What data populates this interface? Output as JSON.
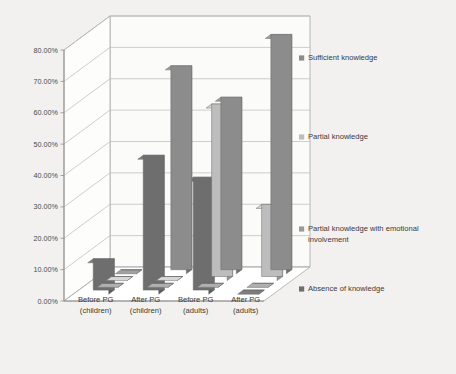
{
  "chart_data": {
    "type": "bar",
    "title": "",
    "subtitle": "",
    "xlabel": "",
    "ylabel": "",
    "categories": [
      "Before PG (children)",
      "After PG (children)",
      "Before PG (adults)",
      "After PG (adults)"
    ],
    "category_lines": [
      [
        "Before PG",
        "(children)"
      ],
      [
        "After PG",
        "(children)"
      ],
      [
        "Before PG",
        "(adults)"
      ],
      [
        "After PG",
        "(adults)"
      ]
    ],
    "series": [
      {
        "name": "Sufficient knowledge",
        "color": "#8c8c8c",
        "values": [
          0,
          65,
          55,
          75
        ]
      },
      {
        "name": "Partial knowledge",
        "color": "#bdbdbd",
        "values": [
          0,
          0,
          55,
          23
        ]
      },
      {
        "name": "Partial knowledge with emotional involvement",
        "color": "#9a9a9a",
        "values": [
          0,
          0,
          0,
          0
        ]
      },
      {
        "name": "Absence of knowledge",
        "color": "#6e6e6e",
        "values": [
          10,
          43,
          36,
          0
        ]
      }
    ],
    "ylim": [
      0,
      80
    ],
    "ytick_values": [
      0,
      10,
      20,
      30,
      40,
      50,
      60,
      70,
      80
    ],
    "ytick_labels": [
      "0.00%",
      "10.00%",
      "20.00%",
      "30.00%",
      "40.00%",
      "50.00%",
      "60.00%",
      "70.00%",
      "80.00%"
    ],
    "grid": true,
    "legend_position": "right",
    "three_d": true
  },
  "legend": {
    "items": [
      {
        "label": "Sufficient knowledge",
        "color": "#8c8c8c"
      },
      {
        "label": "Partial knowledge",
        "color": "#bdbdbd"
      },
      {
        "label": "Partial knowledge with emotional involvement",
        "color": "#9a9a9a"
      },
      {
        "label": "Absence of knowledge",
        "color": "#6e6e6e"
      }
    ],
    "line3_part1": "Partial knowledge with emotional",
    "line3_part2": "involvement"
  },
  "axis": {
    "y_labels": [
      "80.00%",
      "70.00%",
      "60.00%",
      "50.00%",
      "40.00%",
      "30.00%",
      "20.00%",
      "10.00%",
      "0.00%"
    ]
  }
}
